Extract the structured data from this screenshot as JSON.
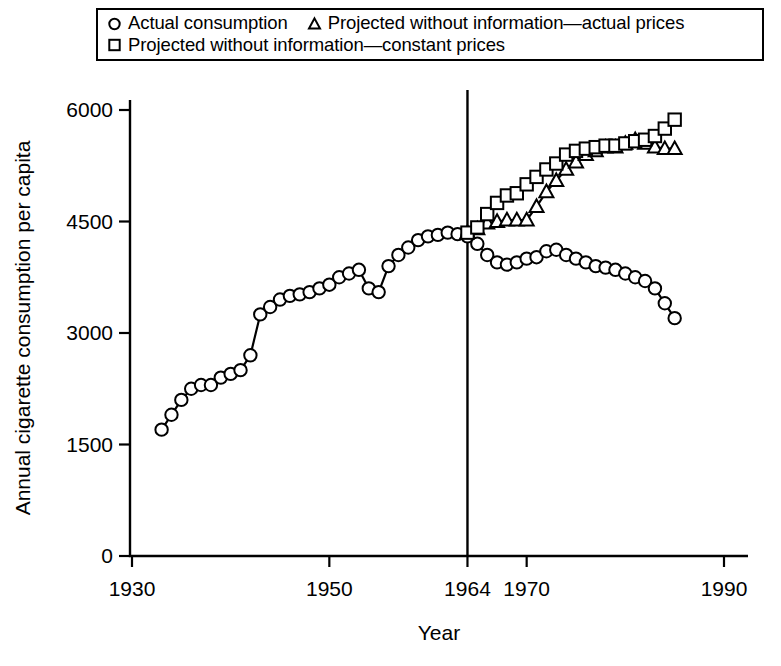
{
  "legend": {
    "rows": [
      [
        {
          "marker": "circle-marker",
          "label": "Actual consumption"
        },
        {
          "marker": "triangle-marker",
          "label": "Projected without information—actual prices"
        }
      ],
      [
        {
          "marker": "square-marker",
          "label": "Projected without information—constant prices"
        }
      ]
    ]
  },
  "chart_data": {
    "type": "line",
    "title": "",
    "xlabel": "Year",
    "ylabel": "Annual cigarette consumption per capita",
    "xlim": [
      1930,
      1990
    ],
    "ylim": [
      0,
      6000
    ],
    "xticks": [
      1930,
      1950,
      1964,
      1970,
      1990
    ],
    "xtick_labels": [
      "1930",
      "1950",
      "1964",
      "1970",
      "1990"
    ],
    "yticks": [
      0,
      1500,
      3000,
      4500,
      6000
    ],
    "ytick_labels": [
      "0",
      "1500",
      "3000",
      "4500",
      "6000"
    ],
    "grid": false,
    "legend_position": "top",
    "annotations": [
      {
        "name": "surgeon-general-report-line",
        "type": "vline",
        "x": 1964,
        "label": "1964"
      }
    ],
    "series": [
      {
        "name": "Actual consumption",
        "marker": "circle",
        "x": [
          1933,
          1934,
          1935,
          1936,
          1937,
          1938,
          1939,
          1940,
          1941,
          1942,
          1943,
          1944,
          1945,
          1946,
          1947,
          1948,
          1949,
          1950,
          1951,
          1952,
          1953,
          1954,
          1955,
          1956,
          1957,
          1958,
          1959,
          1960,
          1961,
          1962,
          1963,
          1964,
          1965,
          1966,
          1967,
          1968,
          1969,
          1970,
          1971,
          1972,
          1973,
          1974,
          1975,
          1976,
          1977,
          1978,
          1979,
          1980,
          1981,
          1982,
          1983,
          1984,
          1985
        ],
        "y": [
          1700,
          1900,
          2100,
          2250,
          2300,
          2300,
          2400,
          2450,
          2500,
          2700,
          3250,
          3350,
          3450,
          3500,
          3520,
          3550,
          3600,
          3650,
          3750,
          3800,
          3850,
          3600,
          3550,
          3900,
          4050,
          4150,
          4250,
          4300,
          4320,
          4350,
          4330,
          4300,
          4200,
          4050,
          3950,
          3920,
          3950,
          4000,
          4020,
          4100,
          4120,
          4050,
          4000,
          3950,
          3900,
          3880,
          3850,
          3800,
          3750,
          3700,
          3600,
          3400,
          3200
        ]
      },
      {
        "name": "Projected without information—actual prices",
        "marker": "triangle",
        "x": [
          1964,
          1965,
          1966,
          1967,
          1968,
          1969,
          1970,
          1971,
          1972,
          1973,
          1974,
          1975,
          1976,
          1977,
          1978,
          1979,
          1980,
          1981,
          1982,
          1983,
          1984,
          1985
        ],
        "y": [
          4350,
          4400,
          4480,
          4500,
          4520,
          4520,
          4520,
          4700,
          4900,
          5050,
          5200,
          5300,
          5400,
          5450,
          5500,
          5500,
          5550,
          5600,
          5550,
          5500,
          5480,
          5480
        ]
      },
      {
        "name": "Projected without information—constant prices",
        "marker": "square",
        "x": [
          1964,
          1965,
          1966,
          1967,
          1968,
          1969,
          1970,
          1971,
          1972,
          1973,
          1974,
          1975,
          1976,
          1977,
          1978,
          1979,
          1980,
          1981,
          1982,
          1983,
          1984,
          1985
        ],
        "y": [
          4350,
          4420,
          4600,
          4750,
          4850,
          4880,
          5000,
          5100,
          5200,
          5280,
          5400,
          5450,
          5480,
          5500,
          5520,
          5520,
          5550,
          5580,
          5600,
          5650,
          5750,
          5870
        ]
      }
    ]
  }
}
